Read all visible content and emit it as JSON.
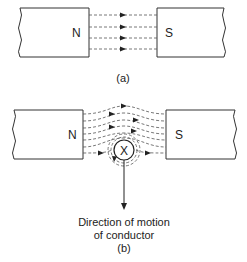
{
  "figure_a": {
    "north_label": "N",
    "south_label": "S",
    "caption": "(a)",
    "field_direction": "N-to-S"
  },
  "figure_b": {
    "north_label": "N",
    "south_label": "S",
    "conductor_symbol": "X",
    "motion_label_line1": "Direction of motion",
    "motion_label_line2": "of conductor",
    "caption": "(b)"
  }
}
